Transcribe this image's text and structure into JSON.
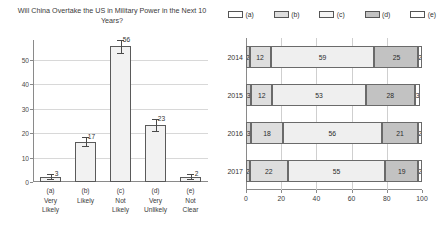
{
  "chart_data": [
    {
      "type": "bar",
      "title": "Will China Overtake the US in Military Power in the Next 10 Years?",
      "categories": [
        "(a)\nVery\nLikely",
        "(b)\nLikely",
        "(c)\nNot\nLikely",
        "(d)\nVery\nUnlikely",
        "(e)\nNot\nClear"
      ],
      "category_lines": [
        [
          "(a)",
          "Very",
          "Likely"
        ],
        [
          "(b)",
          "Likely",
          ""
        ],
        [
          "(c)",
          "Not",
          "Likely"
        ],
        [
          "(d)",
          "Very",
          "Unlikely"
        ],
        [
          "(e)",
          "Not",
          "Clear"
        ]
      ],
      "values": [
        2,
        16.5,
        55.5,
        23.2,
        2
      ],
      "data_labels": [
        "3",
        "17",
        "56",
        "23",
        "2"
      ],
      "error_low": [
        1.2,
        14.8,
        52.8,
        21.0,
        1.2
      ],
      "error_high": [
        3.4,
        18.2,
        58.2,
        25.6,
        3.2
      ],
      "xlabel": "",
      "ylabel": "",
      "ylim": [
        0,
        58
      ],
      "yticks": [
        0,
        10,
        20,
        30,
        40,
        50
      ],
      "grid": true,
      "bar_fill": "#f2f2f2",
      "bar_stroke": "#5a5a5a"
    },
    {
      "type": "bar",
      "orientation": "horizontal",
      "stacked": true,
      "title": "",
      "categories": [
        "2014",
        "2015",
        "2016",
        "2017"
      ],
      "legend": [
        "(a)",
        "(b)",
        "(c)",
        "(d)",
        "(e)"
      ],
      "legend_position": "top",
      "series": [
        {
          "name": "(a)",
          "values": [
            2,
            3,
            3,
            2
          ],
          "color": "#d2d2d2"
        },
        {
          "name": "(b)",
          "values": [
            12,
            12,
            18,
            22
          ],
          "color": "#dedede"
        },
        {
          "name": "(c)",
          "values": [
            59,
            53,
            56,
            55
          ],
          "color": "#efefef"
        },
        {
          "name": "(d)",
          "values": [
            25,
            28,
            21,
            19
          ],
          "color": "#c2c2c2"
        },
        {
          "name": "(e)",
          "values": [
            2,
            3,
            2,
            2
          ],
          "color": "#ffffff"
        }
      ],
      "legend_colors": [
        "#ffffff",
        "#dedede",
        "#f4f4f4",
        "#c2c2c2",
        "#ffffff"
      ],
      "xlabel": "",
      "ylabel": "",
      "xlim": [
        0,
        100
      ],
      "xticks": [
        0,
        20,
        40,
        60,
        80,
        100
      ],
      "grid": true
    }
  ]
}
